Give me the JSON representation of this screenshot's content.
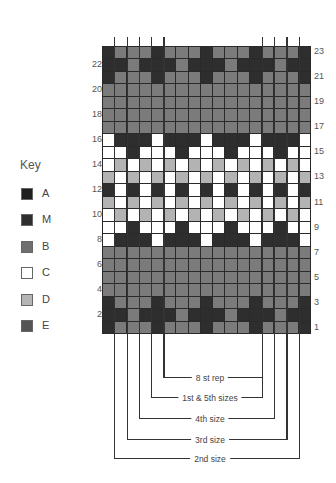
{
  "key": {
    "title": "Key",
    "items": [
      {
        "label": "A",
        "color": "#1f1f1f"
      },
      {
        "label": "M",
        "color": "#2e2e2e"
      },
      {
        "label": "B",
        "color": "#6f6f6f"
      },
      {
        "label": "C",
        "color": "#ffffff"
      },
      {
        "label": "D",
        "color": "#b5b5b5"
      },
      {
        "label": "E",
        "color": "#555555"
      }
    ]
  },
  "colors": {
    "dark": "#2e2e2e",
    "gray": "#7b7b7b",
    "light": "#b3b3b3",
    "white": "#ffffff",
    "gridline": "#2a2a2a"
  },
  "chart": {
    "columns": 17,
    "rows": 23,
    "legend_codes": {
      "K": "dark",
      "G": "gray",
      "L": "light",
      "W": "white"
    },
    "grid_rows_top_to_bottom": [
      {
        "row": 23,
        "cells": "KGGGKGGGKGGGKGGGK"
      },
      {
        "row": 22,
        "cells": "KKGKKKGKKKGKKKGKK"
      },
      {
        "row": 21,
        "cells": "KGGGKGGGKGGGKGGGK"
      },
      {
        "row": 20,
        "cells": "GGGGGGGGGGGGGGGGG"
      },
      {
        "row": 19,
        "cells": "GGGGGGGGGGGGGGGGG"
      },
      {
        "row": 18,
        "cells": "GGGGGGGGGGGGGGGGG"
      },
      {
        "row": 17,
        "cells": "GGGGGGGGGGGGGGGGG"
      },
      {
        "row": 16,
        "cells": "WKKKWKKKWKKKWKKKW"
      },
      {
        "row": 15,
        "cells": "WWKWWWKWWWKWWWKWW"
      },
      {
        "row": 14,
        "cells": "WLWLWLWLWLWLWLWLW"
      },
      {
        "row": 13,
        "cells": "LWLWLWLWLWLWLWLWL"
      },
      {
        "row": 12,
        "cells": "KWKWKWKWKWKWKWKWK"
      },
      {
        "row": 11,
        "cells": "LWLWLWLWLWLWLWLWL"
      },
      {
        "row": 10,
        "cells": "WLWLWLWLWLWLWLWLW"
      },
      {
        "row": 9,
        "cells": "WWKWWWKWWWKWWWKWW"
      },
      {
        "row": 8,
        "cells": "WKKKWKKKWKKKWKKKW"
      },
      {
        "row": 7,
        "cells": "GGGGGGGGGGGGGGGGG"
      },
      {
        "row": 6,
        "cells": "GGGGGGGGGGGGGGGGG"
      },
      {
        "row": 5,
        "cells": "GGGGGGGGGGGGGGGGG"
      },
      {
        "row": 4,
        "cells": "GGGGGGGGGGGGGGGGG"
      },
      {
        "row": 3,
        "cells": "KGGGKGGGKGGGKGGGK"
      },
      {
        "row": 2,
        "cells": "KKGKKKGKKKGKKKGKK"
      },
      {
        "row": 1,
        "cells": "KGGGKGGGKGGGKGGGK"
      }
    ],
    "left_row_numbers": [
      "22",
      "20",
      "18",
      "16",
      "14",
      "12",
      "10",
      "8",
      "6",
      "4",
      "2"
    ],
    "right_row_numbers": [
      "23",
      "21",
      "19",
      "17",
      "15",
      "13",
      "11",
      "9",
      "7",
      "5",
      "3",
      "1"
    ]
  },
  "size_markers": [
    {
      "label": "8 st rep",
      "left_col": 5,
      "right_col": 13
    },
    {
      "label": "1st & 5th sizes",
      "left_col": 4,
      "right_col": 13
    },
    {
      "label": "4th size",
      "left_col": 3,
      "right_col": 14
    },
    {
      "label": "3rd size",
      "left_col": 2,
      "right_col": 15
    },
    {
      "label": "2nd size",
      "left_col": 1,
      "right_col": 16
    }
  ]
}
